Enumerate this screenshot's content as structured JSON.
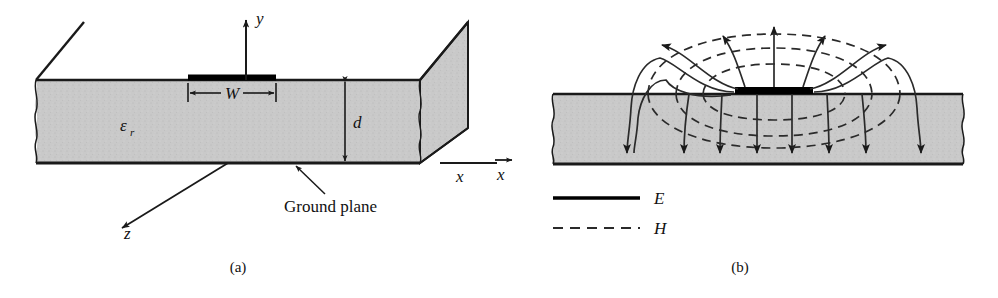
{
  "figure": {
    "panels": [
      {
        "id": "a",
        "caption": "(a)",
        "labels": {
          "axis_y": "y",
          "axis_x": "x",
          "axis_z": "z",
          "width": "W",
          "height": "d",
          "permittivity": "ε",
          "permittivity_sub": "r",
          "ground_plane": "Ground plane"
        }
      },
      {
        "id": "b",
        "caption": "(b)",
        "legend": [
          {
            "key": "E",
            "label": "E",
            "style": "solid"
          },
          {
            "key": "H",
            "label": "H",
            "style": "dashed"
          }
        ]
      }
    ]
  },
  "colors": {
    "substrate_fill": "#c9c9c9",
    "conductor": "#000000",
    "outline": "#1a1a1a",
    "field_line": "#2a2a2a",
    "background": "#ffffff"
  }
}
